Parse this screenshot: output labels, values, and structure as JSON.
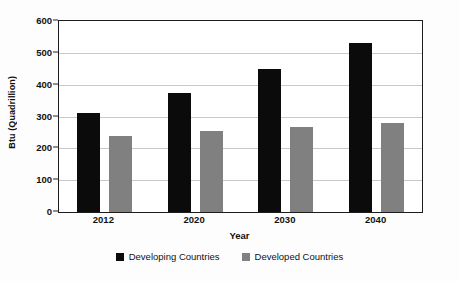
{
  "chart_data": {
    "type": "bar",
    "title": "",
    "xlabel": "Year",
    "ylabel": "Btu (Quadrillion)",
    "categories": [
      "2012",
      "2020",
      "2030",
      "2040"
    ],
    "series": [
      {
        "name": "Developing Countries",
        "color": "#0b0b0b",
        "values": [
          310,
          375,
          450,
          530
        ]
      },
      {
        "name": "Developed Countries",
        "color": "#808080",
        "values": [
          238,
          253,
          267,
          281
        ]
      }
    ],
    "ylim": [
      0,
      600
    ],
    "yticks": [
      0,
      100,
      200,
      300,
      400,
      500,
      600
    ],
    "ytick_labels": [
      "0",
      "100",
      "200",
      "300",
      "400",
      "500",
      "600"
    ],
    "grid": true,
    "legend_position": "bottom-center"
  },
  "axis": {
    "y_title": "Btu (Quadrillion)",
    "x_title": "Year"
  },
  "legend": {
    "entries": [
      {
        "label": "Developing Countries",
        "swatch": "legend-swatch-developing"
      },
      {
        "label": "Developed Countries",
        "swatch": "legend-swatch-developed"
      }
    ]
  }
}
